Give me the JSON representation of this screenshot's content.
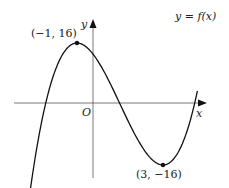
{
  "chart_data": {
    "type": "line",
    "title": "",
    "function_label": "y = f(x)",
    "xlabel": "x",
    "ylabel": "y",
    "origin_label": "O",
    "grid": false,
    "series": [
      {
        "name": "f(x) = x^3 - 3x^2 - 9x + 11",
        "points": [
          [
            -2.6,
            -13.7
          ],
          [
            -2,
            9
          ],
          [
            -1,
            16
          ],
          [
            0,
            11
          ],
          [
            1,
            0
          ],
          [
            2,
            -11
          ],
          [
            3,
            -16
          ],
          [
            4,
            -9
          ],
          [
            4.5,
            1.1
          ],
          [
            4.9,
            15.1
          ]
        ]
      }
    ],
    "annotations": [
      {
        "label": "(−1, 16)",
        "x": -1,
        "y": 16,
        "type": "local maximum"
      },
      {
        "label": "(3, −16)",
        "x": 3,
        "y": -16,
        "type": "local minimum"
      }
    ],
    "axis_arrows": true
  },
  "labels": {
    "func": "y = f(x)",
    "y_axis": "y",
    "x_axis": "x",
    "origin": "O",
    "max_point": "(−1, 16)",
    "min_point": "(3, −16)"
  }
}
